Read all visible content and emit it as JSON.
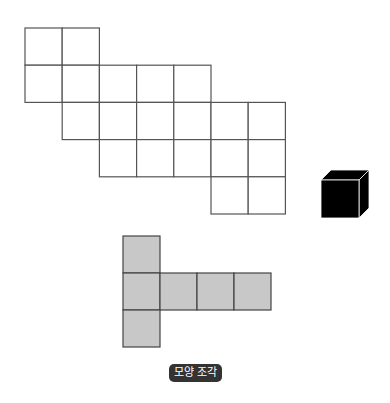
{
  "diagram": {
    "net_grid": {
      "origin_x": 25,
      "origin_y": 28,
      "cell": 37.2,
      "stroke": "#555555",
      "fill": "#ffffff",
      "rows": [
        {
          "row": 0,
          "cols": [
            0,
            1
          ]
        },
        {
          "row": 1,
          "cols": [
            0,
            1,
            2,
            3,
            4
          ]
        },
        {
          "row": 2,
          "cols": [
            1,
            2,
            3,
            4,
            5,
            6
          ]
        },
        {
          "row": 3,
          "cols": [
            2,
            3,
            4,
            5,
            6
          ]
        },
        {
          "row": 4,
          "cols": [
            5,
            6
          ]
        }
      ]
    },
    "cube": {
      "x": 321,
      "y": 180,
      "size": 38,
      "depth": 10,
      "fill": "#000000",
      "edge": "#ffffff"
    },
    "piece": {
      "origin_x": 123,
      "origin_y": 236,
      "cell": 37,
      "stroke": "#444444",
      "fill": "#c8c8c8",
      "cells": [
        [
          0,
          0
        ],
        [
          1,
          0
        ],
        [
          1,
          1
        ],
        [
          1,
          2
        ],
        [
          1,
          3
        ],
        [
          2,
          0
        ]
      ]
    },
    "label": {
      "text": "모양 조각",
      "bg": "#333333",
      "color": "#ffffff"
    }
  }
}
